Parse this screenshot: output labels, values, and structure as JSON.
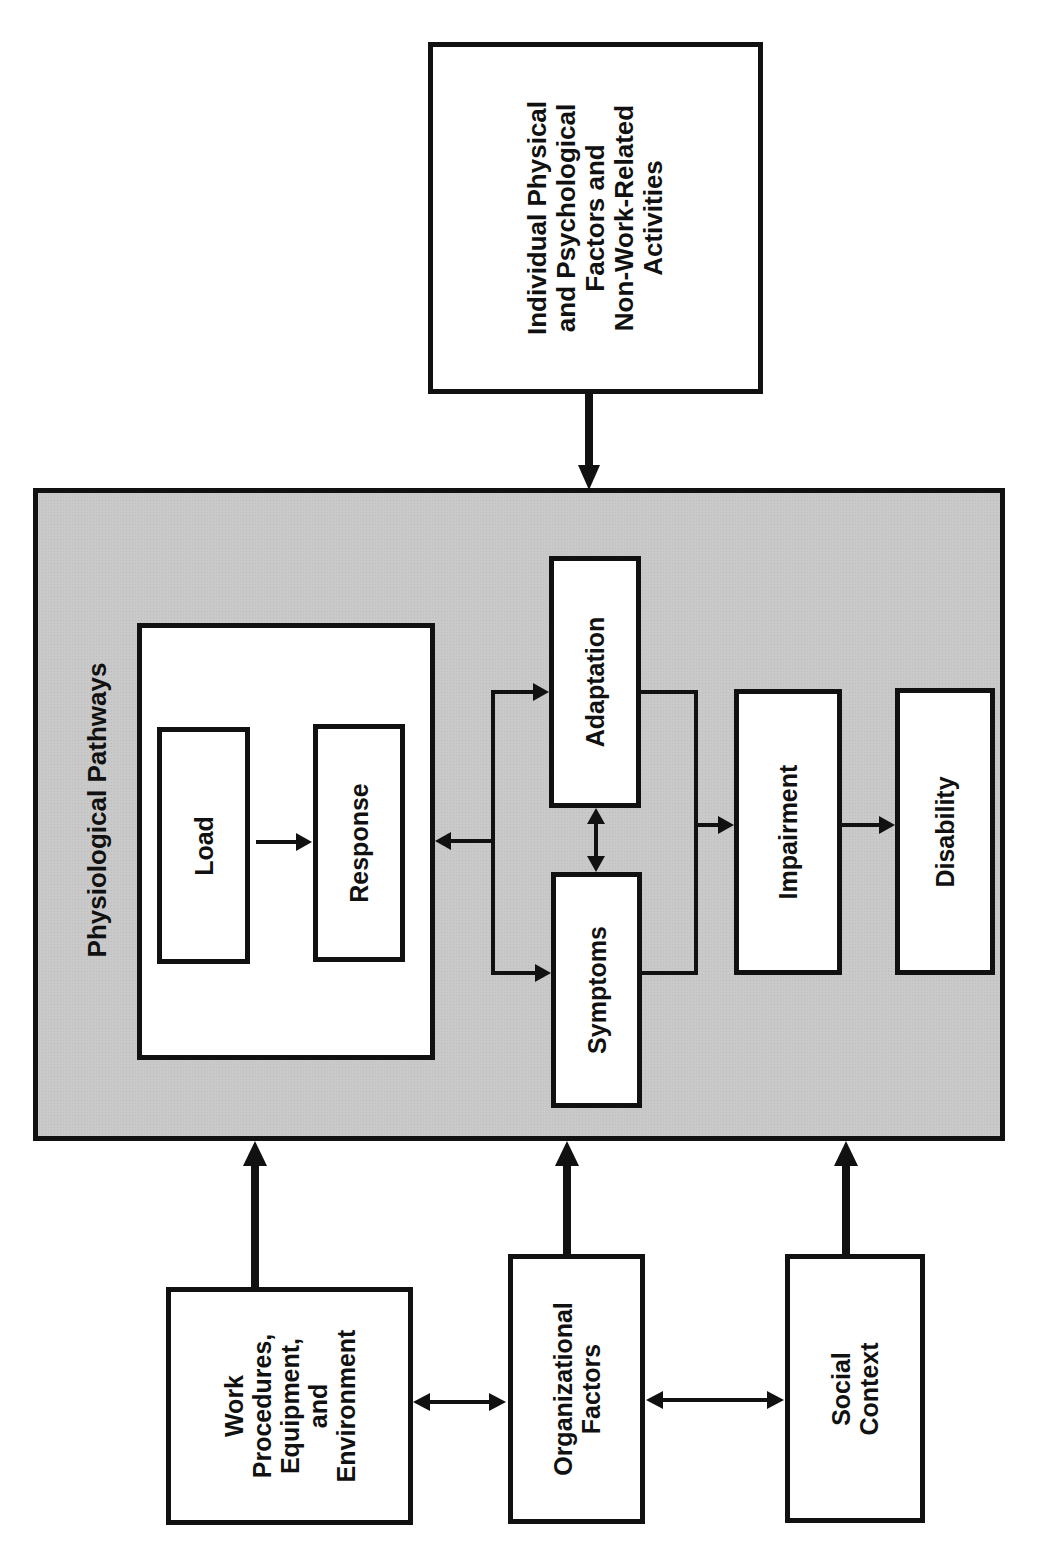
{
  "diagram": {
    "individual_factors": {
      "lines": [
        "Individual Physical",
        "and Psychological",
        "Factors and",
        "Non-Work-Related",
        "Activities"
      ]
    },
    "physiological_pathways": {
      "title": "Physiological Pathways",
      "load": "Load",
      "response": "Response",
      "adaptation": "Adaptation",
      "symptoms": "Symptoms",
      "impairment": "Impairment",
      "disability": "Disability"
    },
    "work_procedures": {
      "lines": [
        "Work",
        "Procedures,",
        "Equipment,",
        "and",
        "Environment"
      ]
    },
    "organizational_factors": {
      "lines": [
        "Organizational",
        "Factors"
      ]
    },
    "social_context": {
      "lines": [
        "Social",
        "Context"
      ]
    },
    "colors": {
      "container_fill": "#c9c9c9",
      "box_fill": "#ffffff",
      "stroke": "#111111"
    },
    "edges": [
      {
        "from": "Individual Physical and Psychological Factors and Non-Work-Related Activities",
        "to": "Physiological Pathways",
        "type": "thick"
      },
      {
        "from": "Work Procedures, Equipment, and Environment",
        "to": "Physiological Pathways",
        "type": "thick"
      },
      {
        "from": "Organizational Factors",
        "to": "Physiological Pathways",
        "type": "thick"
      },
      {
        "from": "Social Context",
        "to": "Physiological Pathways",
        "type": "thick"
      },
      {
        "from": "Work Procedures, Equipment, and Environment",
        "to": "Organizational Factors",
        "type": "bidirectional"
      },
      {
        "from": "Organizational Factors",
        "to": "Social Context",
        "type": "bidirectional"
      },
      {
        "from": "Load",
        "to": "Response",
        "type": "thin"
      },
      {
        "from": "Adaptation/Symptoms junction",
        "to": "Response",
        "type": "thin"
      },
      {
        "from": "Response junction",
        "to": "Adaptation",
        "type": "thin"
      },
      {
        "from": "Response junction",
        "to": "Symptoms",
        "type": "thin"
      },
      {
        "from": "Adaptation",
        "to": "Symptoms",
        "type": "bidirectional"
      },
      {
        "from": "Adaptation/Symptoms",
        "to": "Impairment",
        "type": "thin"
      },
      {
        "from": "Impairment",
        "to": "Disability",
        "type": "thin"
      }
    ]
  }
}
